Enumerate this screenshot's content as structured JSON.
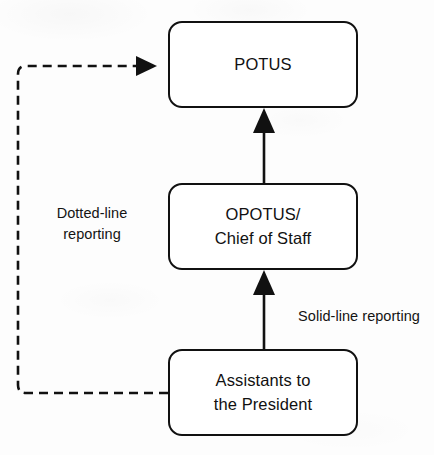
{
  "diagram": {
    "background_color": "#fdfdfd",
    "line_color": "#111111",
    "text_color": "#111111",
    "nodes": [
      {
        "id": "potus",
        "label": "POTUS"
      },
      {
        "id": "opotus",
        "label": "OPOTUS/\nChief of Staff"
      },
      {
        "id": "assist",
        "label": "Assistants to\nthe President"
      }
    ],
    "edges": [
      {
        "id": "assistants-to-opotus",
        "from": "assist",
        "to": "opotus",
        "style": "solid",
        "arrow": "up",
        "label": "Solid-line reporting"
      },
      {
        "id": "opotus-to-potus",
        "from": "opotus",
        "to": "potus",
        "style": "solid",
        "arrow": "up",
        "label": ""
      },
      {
        "id": "assistants-to-potus",
        "from": "assist",
        "to": "potus",
        "style": "dashed",
        "arrow": "right",
        "label": "Dotted-line\nreporting"
      }
    ],
    "labels": {
      "dotted_reporting": "Dotted-line\nreporting",
      "solid_reporting": "Solid-line reporting"
    }
  }
}
